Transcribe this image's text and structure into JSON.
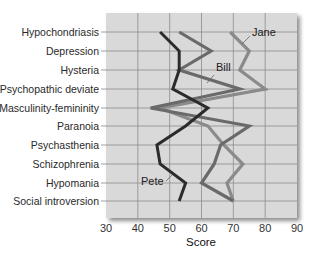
{
  "chart_data": {
    "type": "line",
    "title": "",
    "xlabel": "Score",
    "ylabel": "",
    "xlim": [
      30,
      90
    ],
    "x_ticks": [
      30,
      40,
      50,
      60,
      70,
      80,
      90
    ],
    "grid": true,
    "orientation": "horizontal-profile",
    "categories": [
      "Hypochondriasis",
      "Depression",
      "Hysteria",
      "Psychopathic deviate",
      "Masculinity-femininity",
      "Paranoia",
      "Psychasthenia",
      "Schizophrenia",
      "Hypomania",
      "Social introversion"
    ],
    "series": [
      {
        "name": "Jane",
        "color": "#8a8a8a",
        "values": [
          69,
          75,
          72,
          80,
          47,
          62,
          67,
          73,
          68,
          70
        ]
      },
      {
        "name": "Bill",
        "color": "#6a6a6a",
        "values": [
          53,
          63,
          53,
          72,
          44,
          75,
          66,
          64,
          60,
          70
        ]
      },
      {
        "name": "Pete",
        "color": "#2b2b2b",
        "values": [
          47,
          53,
          53,
          51,
          62,
          55,
          46,
          47,
          55,
          53
        ]
      }
    ],
    "annotations": [
      {
        "text": "Jane",
        "series": "Jane"
      },
      {
        "text": "Bill",
        "series": "Bill"
      },
      {
        "text": "Pete",
        "series": "Pete"
      }
    ]
  },
  "labels": {
    "x_axis_title": "Score"
  }
}
